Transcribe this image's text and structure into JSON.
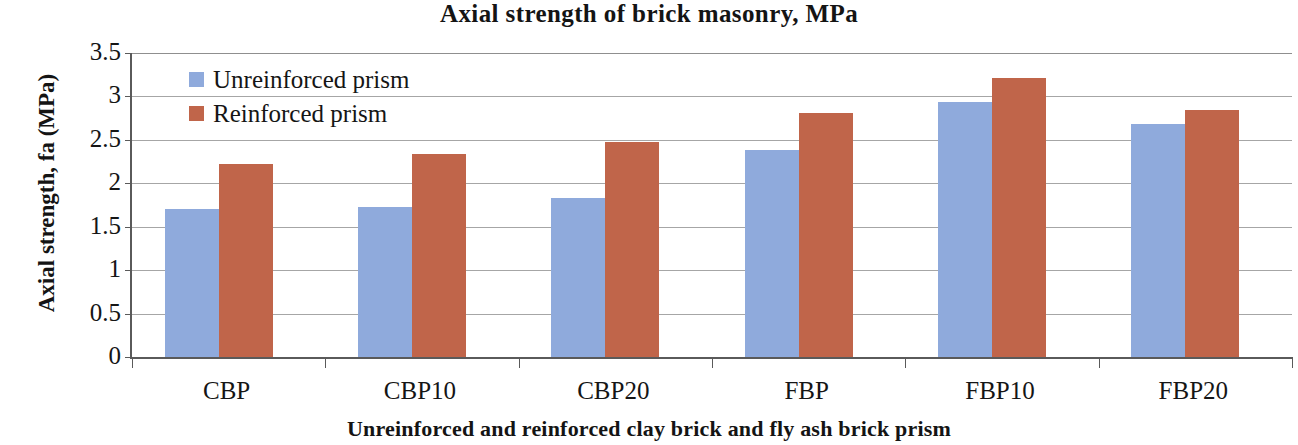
{
  "chart_data": {
    "type": "bar",
    "title": "Axial strength of brick masonry, MPa",
    "xlabel": "Unreinforced and reinforced clay brick and fly ash brick prism",
    "ylabel": "Axial strength, fa (MPa)",
    "categories": [
      "CBP",
      "CBP10",
      "CBP20",
      "FBP",
      "FBP10",
      "FBP20"
    ],
    "series": [
      {
        "name": "Unreinforced prism",
        "color": "#8faadc",
        "values": [
          1.7,
          1.73,
          1.83,
          2.38,
          2.94,
          2.68
        ]
      },
      {
        "name": "Reinforced prism",
        "color": "#c0654a",
        "values": [
          2.22,
          2.34,
          2.47,
          2.81,
          3.21,
          2.84
        ]
      }
    ],
    "ylim": [
      0,
      3.5
    ],
    "yticks": [
      "0",
      "0.5",
      "1",
      "1.5",
      "2",
      "2.5",
      "3",
      "3.5"
    ],
    "ytick_values": [
      0,
      0.5,
      1,
      1.5,
      2,
      2.5,
      3,
      3.5
    ],
    "grid": true,
    "legend_position": "top-left-inside"
  }
}
